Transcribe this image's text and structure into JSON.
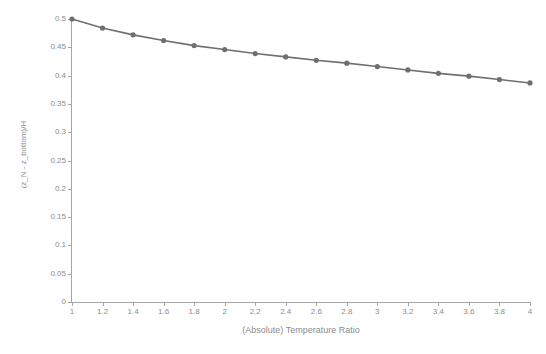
{
  "chart_data": {
    "type": "line",
    "title": "",
    "xlabel": "(Absolute) Temperature Ratio",
    "ylabel": "(z_N - z_bottom)/H",
    "xlim": [
      1,
      4
    ],
    "ylim": [
      0,
      0.5
    ],
    "grid": false,
    "legend": "none",
    "marker": "circle",
    "line_color": "#6f6f6f",
    "marker_color": "#6f6f6f",
    "axis_color": "#a6a6a6",
    "text_color": "#8c8c8c",
    "background_color": "#ffffff",
    "x_ticks": [
      "1",
      "1.2",
      "1.4",
      "1.6",
      "1.8",
      "2",
      "2.2",
      "2.4",
      "2.6",
      "2.8",
      "3",
      "3.2",
      "3.4",
      "3.6",
      "3.8",
      "4"
    ],
    "x_tick_values": [
      1,
      1.2,
      1.4,
      1.6,
      1.8,
      2,
      2.2,
      2.4,
      2.6,
      2.8,
      3,
      3.2,
      3.4,
      3.6,
      3.8,
      4
    ],
    "y_ticks": [
      "0",
      "0.05",
      "0.1",
      "0.15",
      "0.2",
      "0.25",
      "0.3",
      "0.35",
      "0.4",
      "0.45",
      "0.5"
    ],
    "y_tick_values": [
      0,
      0.05,
      0.1,
      0.15,
      0.2,
      0.25,
      0.3,
      0.35,
      0.4,
      0.45,
      0.5
    ],
    "x": [
      1,
      1.2,
      1.4,
      1.6,
      1.8,
      2,
      2.2,
      2.4,
      2.6,
      2.8,
      3,
      3.2,
      3.4,
      3.6,
      3.8,
      4
    ],
    "values": [
      0.5,
      0.484,
      0.472,
      0.462,
      0.453,
      0.446,
      0.439,
      0.433,
      0.427,
      0.422,
      0.416,
      0.41,
      0.404,
      0.399,
      0.393,
      0.387
    ],
    "series": [
      {
        "name": "(z_N - z_bottom)/H",
        "values": [
          0.5,
          0.484,
          0.472,
          0.462,
          0.453,
          0.446,
          0.439,
          0.433,
          0.427,
          0.422,
          0.416,
          0.41,
          0.404,
          0.399,
          0.393,
          0.387
        ]
      }
    ]
  }
}
